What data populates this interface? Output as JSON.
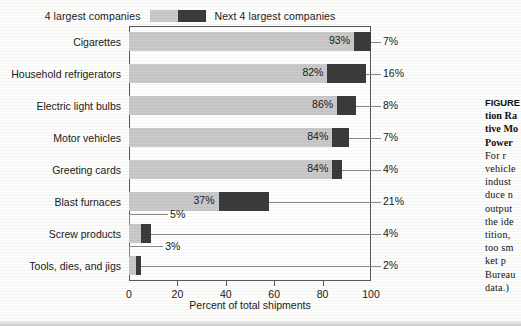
{
  "legend": {
    "left_label": "4 largest companies",
    "right_label": "Next 4 largest companies",
    "swatch_light_color": "#c9c9c9",
    "swatch_dark_color": "#3b3b3b"
  },
  "chart_data": {
    "type": "bar",
    "orientation": "horizontal",
    "stacked": true,
    "title": "",
    "xlabel": "Percent of total shipments",
    "ylabel": "",
    "xlim": [
      0,
      100
    ],
    "xticks": [
      "0",
      "20",
      "40",
      "60",
      "80",
      "100"
    ],
    "xtick_values": [
      0,
      20,
      40,
      60,
      80,
      100
    ],
    "grid": false,
    "legend_position": "top",
    "categories": [
      "Cigarettes",
      "Household refrigerators",
      "Electric light bulbs",
      "Motor vehicles",
      "Greeting cards",
      "Blast furnaces",
      "Screw products",
      "Tools, dies, and jigs"
    ],
    "series": [
      {
        "name": "4 largest companies",
        "color": "#c9c9c9",
        "values": [
          93,
          82,
          86,
          84,
          84,
          37,
          5,
          3
        ],
        "labels": [
          "93%",
          "82%",
          "86%",
          "84%",
          "84%",
          "37%",
          "5%",
          "3%"
        ]
      },
      {
        "name": "Next 4 largest companies",
        "color": "#3b3b3b",
        "values": [
          7,
          16,
          8,
          7,
          4,
          21,
          4,
          2
        ],
        "labels": [
          "7%",
          "16%",
          "8%",
          "7%",
          "4%",
          "21%",
          "4%",
          "2%"
        ]
      }
    ]
  },
  "caption": {
    "heading_lines": [
      "FIGURE",
      "tion Ra",
      "tive Mo",
      "Power"
    ],
    "body_lines": [
      "For  r",
      "vehicle",
      "indust",
      "duce n",
      "output",
      "the ide",
      "tition,",
      "too sm",
      "ket  p",
      "Bureau",
      "data.)"
    ]
  }
}
